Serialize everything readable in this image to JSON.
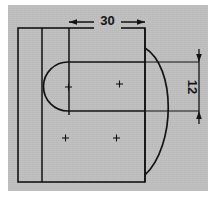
{
  "drawing": {
    "title": "Mechanical part orthographic view",
    "background_color": "#c0c0c0",
    "line_color": "#111111",
    "page_color": "#ffffff",
    "dimensions": [
      {
        "id": "width-30",
        "label": "30",
        "orientation": "horizontal",
        "position": "top",
        "arrow_style": "outward"
      },
      {
        "id": "height-12",
        "label": "12",
        "orientation": "vertical",
        "position": "right",
        "text_rotation": 90,
        "arrow_style": "outward"
      }
    ],
    "features": {
      "outer_plate": "rectangle",
      "fold_line": "vertical line",
      "upper_block": "rectangle",
      "slot": "rounded-end slot",
      "arc": "large right-side arc",
      "center_marks": 4
    }
  }
}
